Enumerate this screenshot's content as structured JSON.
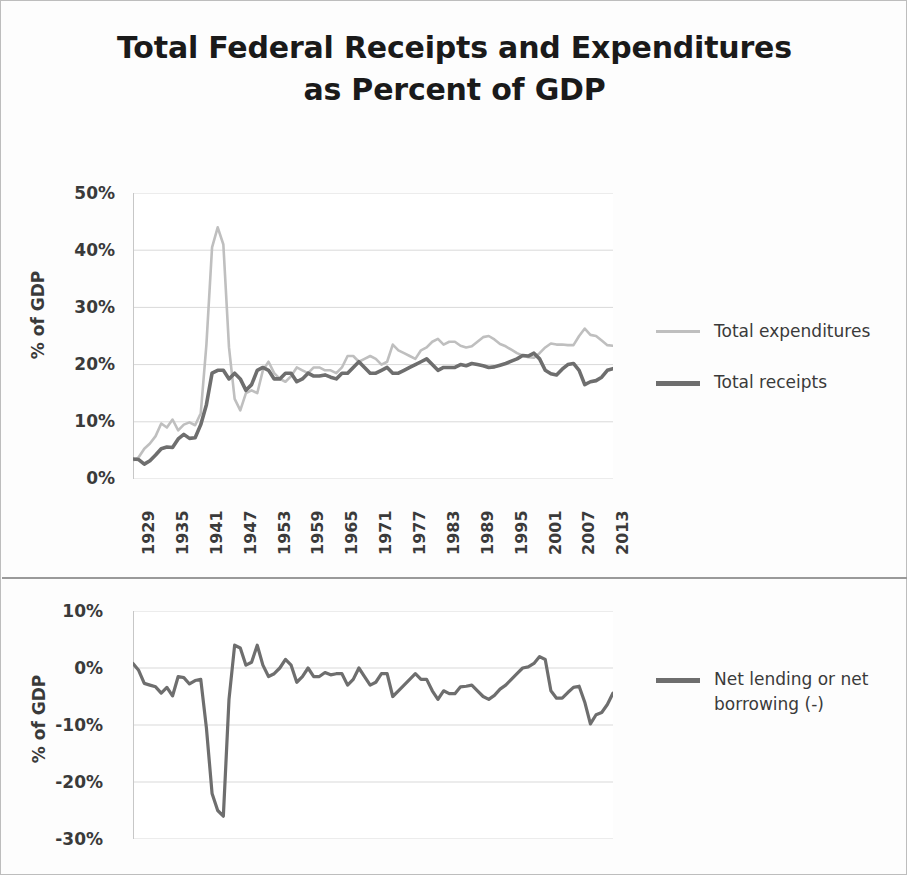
{
  "title": {
    "line1": "Total Federal Receipts and Expenditures",
    "line2": "as Percent of GDP"
  },
  "colors": {
    "expenditures": "#bfbfbf",
    "receipts": "#6e6e6e",
    "net_lending": "#6e6e6e",
    "gridline": "#d9d9d9",
    "axis": "#c7c7c7",
    "text": "#3a3a3a",
    "border": "#bdbdbd"
  },
  "top_chart": {
    "ylabel": "% of GDP",
    "yticks": [
      "50%",
      "40%",
      "30%",
      "20%",
      "10%",
      "0%"
    ],
    "xticks": [
      "1929",
      "1935",
      "1941",
      "1947",
      "1953",
      "1959",
      "1965",
      "1971",
      "1977",
      "1983",
      "1989",
      "1995",
      "2001",
      "2007",
      "2013"
    ],
    "legend": [
      {
        "label": "Total expenditures",
        "icon": "line-swatch-light"
      },
      {
        "label": "Total receipts",
        "icon": "line-swatch-dark"
      }
    ]
  },
  "bottom_chart": {
    "ylabel": "% of GDP",
    "yticks": [
      "10%",
      "0%",
      "-10%",
      "-20%",
      "-30%"
    ],
    "legend": [
      {
        "label": "Net lending or net borrowing (-)",
        "icon": "line-swatch-dark"
      }
    ]
  },
  "chart_data": [
    {
      "type": "line",
      "title": "Total Federal Receipts and Expenditures as Percent of GDP",
      "xlabel": "",
      "ylabel": "% of GDP",
      "xlim": [
        1929,
        2014
      ],
      "ylim": [
        0,
        50
      ],
      "ytick_values": [
        0,
        10,
        20,
        30,
        40,
        50
      ],
      "xtick_values": [
        1929,
        1935,
        1941,
        1947,
        1953,
        1959,
        1965,
        1971,
        1977,
        1983,
        1989,
        1995,
        2001,
        2007,
        2013
      ],
      "grid": true,
      "legend_position": "right",
      "x": [
        1929,
        1930,
        1931,
        1932,
        1933,
        1934,
        1935,
        1936,
        1937,
        1938,
        1939,
        1940,
        1941,
        1942,
        1943,
        1944,
        1945,
        1946,
        1947,
        1948,
        1949,
        1950,
        1951,
        1952,
        1953,
        1954,
        1955,
        1956,
        1957,
        1958,
        1959,
        1960,
        1961,
        1962,
        1963,
        1964,
        1965,
        1966,
        1967,
        1968,
        1969,
        1970,
        1971,
        1972,
        1973,
        1974,
        1975,
        1976,
        1977,
        1978,
        1979,
        1980,
        1981,
        1982,
        1983,
        1984,
        1985,
        1986,
        1987,
        1988,
        1989,
        1990,
        1991,
        1992,
        1993,
        1994,
        1995,
        1996,
        1997,
        1998,
        1999,
        2000,
        2001,
        2002,
        2003,
        2004,
        2005,
        2006,
        2007,
        2008,
        2009,
        2010,
        2011,
        2012,
        2013,
        2014
      ],
      "series": [
        {
          "name": "Total expenditures",
          "color": "#bfbfbf",
          "values": [
            3.2,
            3.8,
            5.3,
            6.2,
            7.5,
            9.7,
            9.0,
            10.4,
            8.5,
            9.5,
            9.9,
            9.4,
            11.5,
            23.5,
            40.5,
            44.0,
            41.0,
            23.0,
            14.0,
            12.0,
            15.0,
            15.5,
            15.0,
            19.0,
            20.5,
            18.5,
            17.5,
            17.0,
            18.0,
            19.5,
            19.0,
            18.5,
            19.5,
            19.5,
            19.0,
            19.0,
            18.5,
            19.5,
            21.5,
            21.5,
            20.5,
            21.0,
            21.5,
            21.0,
            20.0,
            20.5,
            23.5,
            22.5,
            22.0,
            21.5,
            21.0,
            22.5,
            23.0,
            24.0,
            24.5,
            23.5,
            24.0,
            24.0,
            23.3,
            23.0,
            23.2,
            24.0,
            24.8,
            25.0,
            24.4,
            23.6,
            23.2,
            22.6,
            22.0,
            21.6,
            21.3,
            21.2,
            22.0,
            23.0,
            23.7,
            23.5,
            23.5,
            23.4,
            23.4,
            25.0,
            26.3,
            25.2,
            25.0,
            24.2,
            23.4,
            23.3
          ]
        },
        {
          "name": "Total receipts",
          "color": "#6e6e6e",
          "values": [
            3.5,
            3.4,
            2.6,
            3.2,
            4.2,
            5.3,
            5.6,
            5.5,
            7.0,
            7.8,
            7.1,
            7.2,
            9.5,
            13.0,
            18.5,
            19.0,
            19.0,
            17.5,
            18.5,
            17.5,
            15.5,
            16.5,
            19.0,
            19.5,
            19.0,
            17.5,
            17.5,
            18.5,
            18.5,
            17.0,
            17.5,
            18.5,
            18.0,
            18.0,
            18.2,
            17.8,
            17.5,
            18.5,
            18.5,
            19.5,
            20.5,
            19.5,
            18.5,
            18.5,
            19.0,
            19.5,
            18.5,
            18.5,
            19.0,
            19.5,
            20.0,
            20.5,
            21.0,
            20.0,
            19.0,
            19.5,
            19.5,
            19.5,
            20.0,
            19.8,
            20.2,
            20.0,
            19.8,
            19.5,
            19.6,
            19.9,
            20.2,
            20.6,
            21.0,
            21.6,
            21.5,
            22.0,
            21.0,
            19.0,
            18.4,
            18.2,
            19.2,
            20.0,
            20.2,
            19.0,
            16.5,
            17.0,
            17.2,
            17.8,
            19.0,
            19.3
          ]
        }
      ]
    },
    {
      "type": "line",
      "title": "Net lending or net borrowing as Percent of GDP",
      "xlabel": "",
      "ylabel": "% of GDP",
      "xlim": [
        1929,
        2014
      ],
      "ylim": [
        -30,
        10
      ],
      "ytick_values": [
        10,
        0,
        -10,
        -20,
        -30
      ],
      "grid": true,
      "legend_position": "right",
      "x": [
        1929,
        1930,
        1931,
        1932,
        1933,
        1934,
        1935,
        1936,
        1937,
        1938,
        1939,
        1940,
        1941,
        1942,
        1943,
        1944,
        1945,
        1946,
        1947,
        1948,
        1949,
        1950,
        1951,
        1952,
        1953,
        1954,
        1955,
        1956,
        1957,
        1958,
        1959,
        1960,
        1961,
        1962,
        1963,
        1964,
        1965,
        1966,
        1967,
        1968,
        1969,
        1970,
        1971,
        1972,
        1973,
        1974,
        1975,
        1976,
        1977,
        1978,
        1979,
        1980,
        1981,
        1982,
        1983,
        1984,
        1985,
        1986,
        1987,
        1988,
        1989,
        1990,
        1991,
        1992,
        1993,
        1994,
        1995,
        1996,
        1997,
        1998,
        1999,
        2000,
        2001,
        2002,
        2003,
        2004,
        2005,
        2006,
        2007,
        2008,
        2009,
        2010,
        2011,
        2012,
        2013,
        2014
      ],
      "series": [
        {
          "name": "Net lending or net borrowing (-)",
          "color": "#6e6e6e",
          "values": [
            0.8,
            -0.4,
            -2.7,
            -3.0,
            -3.3,
            -4.4,
            -3.4,
            -4.9,
            -1.5,
            -1.7,
            -2.8,
            -2.2,
            -2.0,
            -10.5,
            -22.0,
            -25.0,
            -26.0,
            -5.5,
            4.0,
            3.5,
            0.5,
            1.0,
            4.0,
            0.5,
            -1.5,
            -1.0,
            0.0,
            1.5,
            0.5,
            -2.5,
            -1.5,
            0.0,
            -1.5,
            -1.5,
            -0.8,
            -1.2,
            -1.0,
            -1.0,
            -3.0,
            -2.0,
            0.0,
            -1.5,
            -3.0,
            -2.5,
            -1.0,
            -1.0,
            -5.0,
            -4.0,
            -3.0,
            -2.0,
            -1.0,
            -2.0,
            -2.0,
            -4.0,
            -5.5,
            -4.0,
            -4.5,
            -4.5,
            -3.3,
            -3.2,
            -3.0,
            -4.0,
            -5.0,
            -5.5,
            -4.8,
            -3.7,
            -3.0,
            -2.0,
            -1.0,
            0.0,
            0.2,
            0.8,
            2.0,
            1.5,
            -4.0,
            -5.3,
            -5.3,
            -4.3,
            -3.4,
            -3.2,
            -6.0,
            -9.8,
            -8.2,
            -7.8,
            -6.4,
            -4.4,
            -4.0
          ]
        }
      ]
    }
  ]
}
